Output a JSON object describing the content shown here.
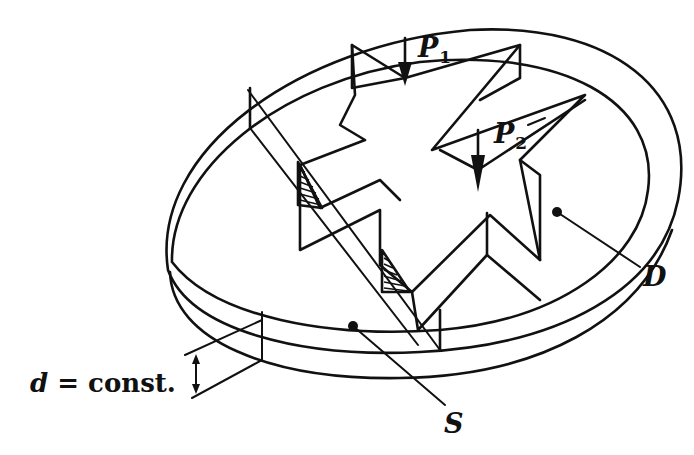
{
  "figure": {
    "colors": {
      "ink": "#111111",
      "background": "#ffffff"
    }
  },
  "labels": {
    "p1": {
      "symbol": "P",
      "subscript": "1"
    },
    "p2": {
      "symbol": "P",
      "subscript": "2"
    },
    "domain": "D",
    "boundary": "S",
    "thickness": {
      "variable": "d",
      "relation": "= const."
    }
  }
}
